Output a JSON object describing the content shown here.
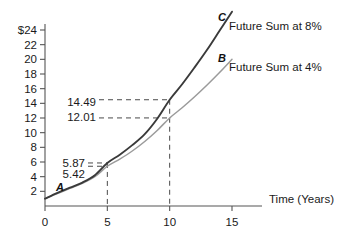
{
  "chart_data": {
    "type": "line",
    "title": "",
    "xlabel": "Time (Years)",
    "ylabel": "",
    "xlim": [
      0,
      16.5
    ],
    "ylim": [
      0,
      26
    ],
    "grid": false,
    "legend_position": "inline-right",
    "x_ticks": [
      "0",
      "5",
      "10",
      "15"
    ],
    "x_tick_values": [
      0,
      5,
      10,
      15
    ],
    "y_ticks": [
      "2",
      "4",
      "6",
      "8",
      "10",
      "12",
      "14",
      "16",
      "18",
      "20",
      "22",
      "$24"
    ],
    "y_tick_values": [
      2,
      4,
      6,
      8,
      10,
      12,
      14,
      16,
      18,
      20,
      22,
      24
    ],
    "series": [
      {
        "name": "Future Sum at 8%",
        "letter": "C",
        "color": "#3a3a3a",
        "x": [
          0,
          1,
          2,
          3,
          4,
          5,
          6,
          7,
          8,
          9,
          10,
          11,
          12,
          13,
          14,
          15
        ],
        "values": [
          1.0,
          1.8,
          2.5,
          3.2,
          4.2,
          5.87,
          7.0,
          8.3,
          9.8,
          11.9,
          14.49,
          16.6,
          18.9,
          21.3,
          23.9,
          26.5
        ]
      },
      {
        "name": "Future Sum at 4%",
        "letter": "B",
        "color": "#9b9b9b",
        "x": [
          0,
          1,
          2,
          3,
          4,
          5,
          6,
          7,
          8,
          9,
          10,
          11,
          12,
          13,
          14,
          15
        ],
        "values": [
          1.0,
          1.7,
          2.4,
          3.1,
          4.0,
          5.42,
          6.4,
          7.5,
          8.8,
          10.3,
          12.01,
          13.4,
          14.9,
          16.5,
          18.2,
          20.0
        ]
      }
    ],
    "origin_letter": "A",
    "annotations": [
      {
        "label": "14.49",
        "y_value": 14.49,
        "x_value": 10,
        "series": "C"
      },
      {
        "label": "12.01",
        "y_value": 12.01,
        "x_value": 10,
        "series": "B"
      },
      {
        "label": "5.87",
        "y_value": 5.87,
        "x_value": 5,
        "series": "C"
      },
      {
        "label": "5.42",
        "y_value": 5.42,
        "x_value": 5,
        "series": "B"
      }
    ]
  },
  "labels": {
    "series_c_letter": "C",
    "series_c_caption": "Future Sum at 8%",
    "series_b_letter": "B",
    "series_b_caption": "Future Sum at 4%",
    "origin_point": "A",
    "x_axis_title": "Time (Years)",
    "annot_1449": "14.49",
    "annot_1201": "12.01",
    "annot_587": "5.87",
    "annot_542": "5.42",
    "ytick_24": "$24",
    "ytick_22": "22",
    "ytick_20": "20",
    "ytick_18": "18",
    "ytick_16": "16",
    "ytick_14": "14",
    "ytick_12": "12",
    "ytick_10": "10",
    "ytick_8": "8",
    "ytick_6": "6",
    "ytick_4": "4",
    "ytick_2": "2",
    "xtick_0": "0",
    "xtick_5": "5",
    "xtick_10": "10",
    "xtick_15": "15"
  },
  "colors": {
    "series_c": "#3a3a3a",
    "series_b": "#9b9b9b",
    "axis": "#555555",
    "guide": "#4a4a4a",
    "background": "#ffffff"
  }
}
